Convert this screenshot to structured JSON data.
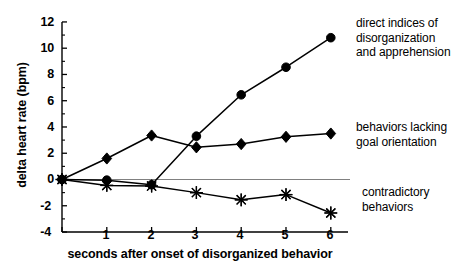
{
  "chart_data": {
    "type": "line",
    "title": "",
    "xlabel": "seconds after onset of disorganized behavior",
    "ylabel": "delta heart rate (bpm)",
    "x": [
      0,
      1,
      2,
      3,
      4,
      5,
      6
    ],
    "xlim": [
      0,
      6.4
    ],
    "ylim": [
      -4,
      12
    ],
    "xticks": [
      0,
      1,
      2,
      3,
      4,
      5,
      6
    ],
    "xtick_labels": [
      "",
      "1",
      "2",
      "3",
      "4",
      "5",
      "6"
    ],
    "yticks": [
      -4,
      -2,
      0,
      2,
      4,
      6,
      8,
      10,
      12
    ],
    "ytick_labels": [
      "-4",
      "-2",
      "0",
      "2",
      "4",
      "6",
      "8",
      "10",
      "12"
    ],
    "minor_tick_step": 1,
    "grid": false,
    "zero_reference_line": true,
    "legend_position": "right-inline-annotations",
    "series": [
      {
        "name": "direct indices of disorganization and apprehension",
        "marker": "circle",
        "values": [
          0.0,
          -0.05,
          -0.4,
          3.3,
          6.45,
          8.55,
          10.8
        ]
      },
      {
        "name": "behaviors lacking goal orientation",
        "marker": "diamond",
        "values": [
          0.0,
          1.6,
          3.35,
          2.45,
          2.7,
          3.25,
          3.5
        ]
      },
      {
        "name": "contradictory behaviors",
        "marker": "star",
        "values": [
          0.0,
          -0.45,
          -0.5,
          -1.0,
          -1.55,
          -1.15,
          -2.55
        ]
      }
    ],
    "annotations": [
      {
        "id": "direct",
        "lines": [
          "direct indices of",
          "disorganization",
          "and apprehension"
        ]
      },
      {
        "id": "behaviors",
        "lines": [
          "behaviors lacking",
          "goal orientation"
        ]
      },
      {
        "id": "contradictory",
        "lines": [
          "contradictory",
          "behaviors"
        ]
      }
    ],
    "colors": {
      "line": "#000000",
      "marker": "#000000",
      "axis": "#000000",
      "zero_line": "#808080",
      "background": "#ffffff"
    }
  }
}
